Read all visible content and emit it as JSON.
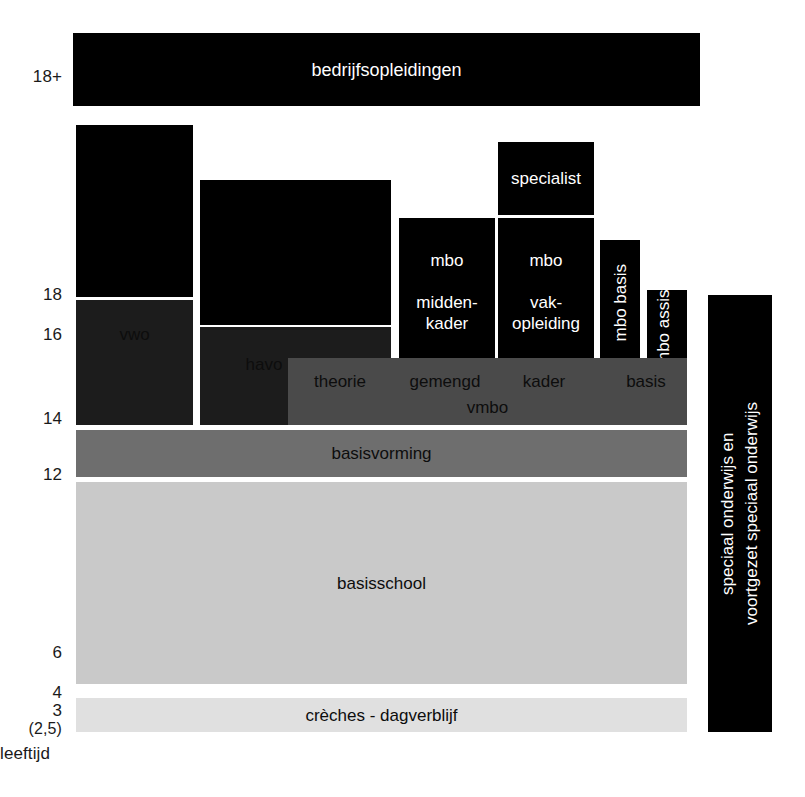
{
  "diagram": {
    "axis_caption": "leeftijd",
    "caption_ghost": " ",
    "colors": {
      "black": "#000000",
      "near_black": "#1c1c1c",
      "dark_gray": "#4a4a4a",
      "mid_gray": "#6e6e6e",
      "light_gray": "#c9c9c9",
      "lightest_gray": "#e0e0e0",
      "background": "#ffffff"
    }
  },
  "axis": {
    "name": "leeftijd",
    "ticks": [
      {
        "label": "18+"
      },
      {
        "label": "18"
      },
      {
        "label": "16"
      },
      {
        "label": "14"
      },
      {
        "label": "12"
      },
      {
        "label": "6"
      },
      {
        "label": "4"
      },
      {
        "label": "3"
      },
      {
        "label": "(2,5)"
      }
    ]
  },
  "blocks": {
    "bedrijfsopleidingen": "bedrijfsopleidingen",
    "vwo": "vwo",
    "havo": "havo",
    "mbo_middenkader": "mbo\n\nmidden-\nkader",
    "mbo_vakopleiding": "mbo\n\nvak-\nopleiding",
    "specialist": "specialist",
    "mbo_basis": "mbo basis",
    "mbo_assistent": "mbo assistent",
    "vmbo": "vmbo",
    "vmbo_theorie": "theorie",
    "vmbo_gemengd": "gemengd",
    "vmbo_kader": "kader",
    "vmbo_basis": "basis",
    "basisvorming": "basisvorming",
    "basisschool": "basisschool",
    "creches": "crèches - dagverblijf",
    "speciaal_onderwijs": "speciaal onderwijs en\nvoortgezet speciaal onderwijs"
  }
}
